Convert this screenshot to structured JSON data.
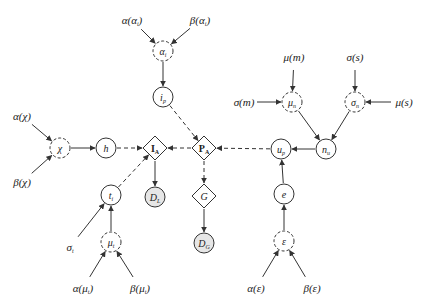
{
  "diagram": {
    "type": "probabilistic graphical model",
    "nodes": [
      {
        "id": "alpha_alpha_i",
        "kind": "hyperparameter",
        "label": "α(α",
        "sub": "i",
        "suffix": ")",
        "x": 132,
        "y": 20
      },
      {
        "id": "beta_alpha_i",
        "kind": "hyperparameter",
        "label": "β(α",
        "sub": "i",
        "suffix": ")",
        "x": 200,
        "y": 20
      },
      {
        "id": "alpha_i",
        "kind": "latent-dashed",
        "label": "α",
        "sub": "i",
        "x": 163,
        "y": 51
      },
      {
        "id": "i_p",
        "kind": "variable",
        "label": "i",
        "sub": "p",
        "x": 163,
        "y": 97
      },
      {
        "id": "alpha_chi",
        "kind": "hyperparameter",
        "label": "α(χ)",
        "sub": "",
        "suffix": "",
        "x": 22,
        "y": 116
      },
      {
        "id": "beta_chi",
        "kind": "hyperparameter",
        "label": "β(χ)",
        "sub": "",
        "suffix": "",
        "x": 22,
        "y": 182
      },
      {
        "id": "chi",
        "kind": "latent-dashed",
        "label": "χ",
        "sub": "",
        "x": 60,
        "y": 148
      },
      {
        "id": "h",
        "kind": "variable",
        "label": "h",
        "sub": "",
        "x": 106,
        "y": 148
      },
      {
        "id": "I_A",
        "kind": "deterministic",
        "label": "I",
        "sub": "A",
        "x": 155,
        "y": 148
      },
      {
        "id": "P_A",
        "kind": "deterministic",
        "label": "P",
        "sub": "A",
        "x": 204,
        "y": 148
      },
      {
        "id": "u_p",
        "kind": "variable",
        "label": "u",
        "sub": "p",
        "x": 281,
        "y": 149
      },
      {
        "id": "n_u",
        "kind": "variable",
        "label": "n",
        "sub": "u",
        "x": 326,
        "y": 149
      },
      {
        "id": "mu_m",
        "kind": "hyperparameter",
        "label": "μ(m)",
        "sub": "",
        "suffix": "",
        "x": 294,
        "y": 57
      },
      {
        "id": "sigma_s",
        "kind": "hyperparameter",
        "label": "σ(s)",
        "sub": "",
        "suffix": "",
        "x": 355,
        "y": 57
      },
      {
        "id": "sigma_m",
        "kind": "hyperparameter",
        "label": "σ(m)",
        "sub": "",
        "suffix": "",
        "x": 244,
        "y": 102
      },
      {
        "id": "mu_n",
        "kind": "latent-dashed",
        "label": "μ",
        "sub": "n",
        "x": 292,
        "y": 102
      },
      {
        "id": "sigma_n",
        "kind": "latent-dashed",
        "label": "σ",
        "sub": "n",
        "x": 355,
        "y": 102
      },
      {
        "id": "mu_s",
        "kind": "hyperparameter",
        "label": "μ(s)",
        "sub": "",
        "suffix": "",
        "x": 404,
        "y": 102
      },
      {
        "id": "D_L",
        "kind": "observed",
        "label": "D",
        "sub": "L",
        "x": 155,
        "y": 197
      },
      {
        "id": "G",
        "kind": "deterministic",
        "label": "G",
        "sub": "",
        "x": 204,
        "y": 196
      },
      {
        "id": "D_G",
        "kind": "observed",
        "label": "D",
        "sub": "G",
        "x": 204,
        "y": 243
      },
      {
        "id": "t_i",
        "kind": "variable",
        "label": "t",
        "sub": "i",
        "x": 111,
        "y": 195
      },
      {
        "id": "sigma_t",
        "kind": "hyperparameter",
        "label": "σ",
        "sub": "t",
        "suffix": "",
        "x": 70,
        "y": 247
      },
      {
        "id": "mu_t",
        "kind": "latent-dashed",
        "label": "μ",
        "sub": "t",
        "x": 111,
        "y": 242
      },
      {
        "id": "alpha_mu_t",
        "kind": "hyperparameter",
        "label": "α(μ",
        "sub": "t",
        "suffix": ")",
        "x": 83,
        "y": 288
      },
      {
        "id": "beta_mu_t",
        "kind": "hyperparameter",
        "label": "β(μ",
        "sub": "t",
        "suffix": ")",
        "x": 140,
        "y": 288
      },
      {
        "id": "e",
        "kind": "variable",
        "label": "e",
        "sub": "",
        "x": 284,
        "y": 194
      },
      {
        "id": "epsilon",
        "kind": "latent-dashed",
        "label": "ε",
        "sub": "",
        "x": 284,
        "y": 241
      },
      {
        "id": "alpha_eps",
        "kind": "hyperparameter",
        "label": "α(ε)",
        "sub": "",
        "suffix": "",
        "x": 256,
        "y": 288
      },
      {
        "id": "beta_eps",
        "kind": "hyperparameter",
        "label": "β(ε)",
        "sub": "",
        "suffix": "",
        "x": 312,
        "y": 288
      }
    ],
    "edges": [
      {
        "from": "alpha_alpha_i",
        "to": "alpha_i",
        "style": "solid"
      },
      {
        "from": "beta_alpha_i",
        "to": "alpha_i",
        "style": "solid"
      },
      {
        "from": "alpha_i",
        "to": "i_p",
        "style": "solid"
      },
      {
        "from": "i_p",
        "to": "P_A",
        "style": "dashed"
      },
      {
        "from": "alpha_chi",
        "to": "chi",
        "style": "solid"
      },
      {
        "from": "beta_chi",
        "to": "chi",
        "style": "solid"
      },
      {
        "from": "chi",
        "to": "h",
        "style": "solid"
      },
      {
        "from": "h",
        "to": "I_A",
        "style": "dashed"
      },
      {
        "from": "P_A",
        "to": "I_A",
        "style": "dashed"
      },
      {
        "from": "u_p",
        "to": "P_A",
        "style": "dashed"
      },
      {
        "from": "n_u",
        "to": "u_p",
        "style": "solid"
      },
      {
        "from": "mu_m",
        "to": "mu_n",
        "style": "solid"
      },
      {
        "from": "sigma_m",
        "to": "mu_n",
        "style": "solid"
      },
      {
        "from": "sigma_s",
        "to": "sigma_n",
        "style": "solid"
      },
      {
        "from": "mu_s",
        "to": "sigma_n",
        "style": "solid"
      },
      {
        "from": "mu_n",
        "to": "n_u",
        "style": "solid"
      },
      {
        "from": "sigma_n",
        "to": "n_u",
        "style": "solid"
      },
      {
        "from": "I_A",
        "to": "D_L",
        "style": "solid"
      },
      {
        "from": "P_A",
        "to": "G",
        "style": "dashed"
      },
      {
        "from": "G",
        "to": "D_G",
        "style": "solid"
      },
      {
        "from": "t_i",
        "to": "I_A",
        "style": "dashed"
      },
      {
        "from": "sigma_t",
        "to": "t_i",
        "style": "solid"
      },
      {
        "from": "mu_t",
        "to": "t_i",
        "style": "solid"
      },
      {
        "from": "alpha_mu_t",
        "to": "mu_t",
        "style": "solid"
      },
      {
        "from": "beta_mu_t",
        "to": "mu_t",
        "style": "solid"
      },
      {
        "from": "e",
        "to": "u_p",
        "style": "solid"
      },
      {
        "from": "epsilon",
        "to": "e",
        "style": "solid"
      },
      {
        "from": "alpha_eps",
        "to": "epsilon",
        "style": "solid"
      },
      {
        "from": "beta_eps",
        "to": "epsilon",
        "style": "solid"
      }
    ],
    "colors": {
      "stroke": "#333333",
      "observed_fill": "#e6e6e6",
      "background": "#ffffff"
    }
  }
}
